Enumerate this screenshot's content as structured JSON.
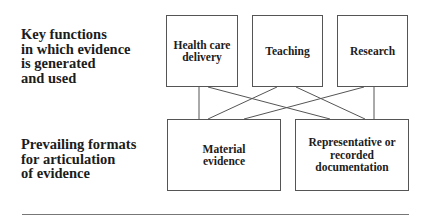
{
  "labels": {
    "top_row": "Key functions\nin which evidence\nis generated\nand used",
    "bottom_row": "Prevailing formats\nfor articulation\nof evidence"
  },
  "functions": [
    {
      "id": "health",
      "label": "Health care\ndelivery"
    },
    {
      "id": "teaching",
      "label": "Teaching"
    },
    {
      "id": "research",
      "label": "Research"
    }
  ],
  "formats": [
    {
      "id": "material",
      "label": "Material\nevidence"
    },
    {
      "id": "document",
      "label": "Representative or\nrecorded\ndocumentation"
    }
  ],
  "connections": [
    {
      "from": "Health care delivery",
      "to": "Material evidence"
    },
    {
      "from": "Health care delivery",
      "to": "Representative or recorded documentation"
    },
    {
      "from": "Teaching",
      "to": "Material evidence"
    },
    {
      "from": "Teaching",
      "to": "Representative or recorded documentation"
    },
    {
      "from": "Research",
      "to": "Material evidence"
    },
    {
      "from": "Research",
      "to": "Representative or recorded documentation"
    }
  ],
  "colors": {
    "line": "#555555",
    "text": "#1c1c1c",
    "background": "#ffffff"
  }
}
